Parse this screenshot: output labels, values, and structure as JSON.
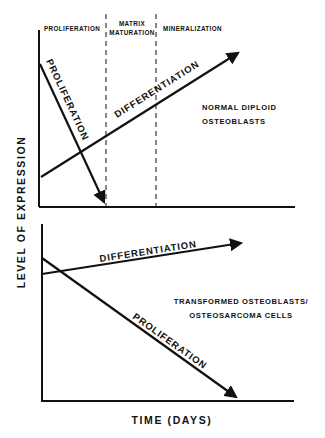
{
  "figure": {
    "y_axis_label": "LEVEL OF EXPRESSION",
    "x_axis_label": "TIME (DAYS)",
    "colors": {
      "ink": "#111111",
      "background": "#ffffff"
    }
  },
  "top_panel": {
    "phases": [
      {
        "label_line1": "PROLIFERATION"
      },
      {
        "label_line1": "MATRIX",
        "label_line2": "MATURATION"
      },
      {
        "label_line1": "MINERALIZATION"
      }
    ],
    "cell_type_line1": "NORMAL DIPLOID",
    "cell_type_line2": "OSTEOBLASTS",
    "curves": {
      "proliferation": "PROLIFERATION",
      "differentiation": "DIFFERENTIATION"
    }
  },
  "bottom_panel": {
    "cell_type_line1": "TRANSFORMED OSTEOBLASTS/",
    "cell_type_line2": "OSTEOSARCOMA CELLS",
    "curves": {
      "proliferation": "PROLIFERATION",
      "differentiation": "DIFFERENTIATION"
    }
  }
}
